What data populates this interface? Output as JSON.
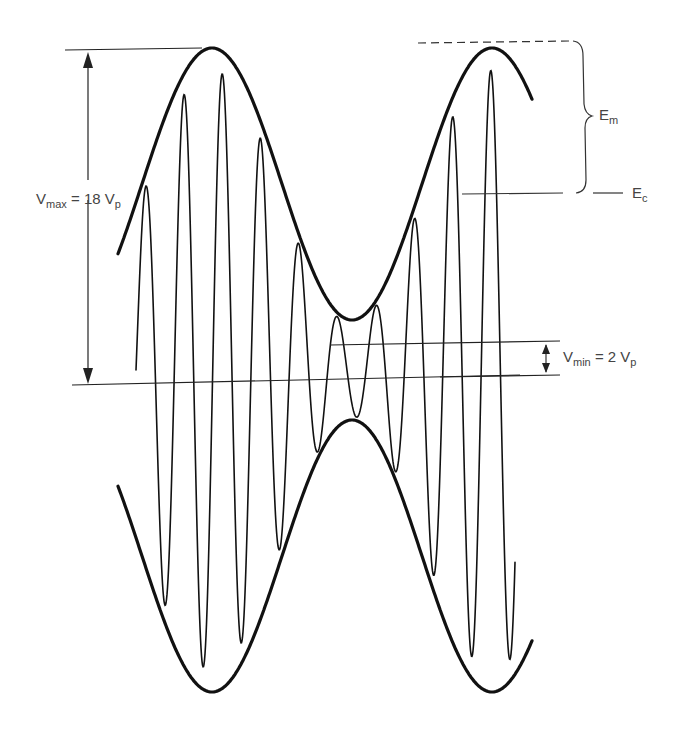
{
  "diagram": {
    "type": "amplitude-modulated waveform",
    "labels": {
      "vmax": {
        "main": "V",
        "sub": "max",
        "rest": " = 18 V",
        "rest_sub": "p"
      },
      "vmin": {
        "main": "V",
        "sub": "min",
        "rest": " = 2 V",
        "rest_sub": "p"
      },
      "em": {
        "main": "E",
        "sub": "m"
      },
      "ec": {
        "main": "E",
        "sub": "c"
      }
    },
    "geometry": {
      "envelope_top_peak_y": 48,
      "envelope_trough_y": 320,
      "vmax_line_y": 385,
      "vmin_top_line_y": 342,
      "ec_line_y": 193,
      "stroke_color": "#111111"
    }
  }
}
